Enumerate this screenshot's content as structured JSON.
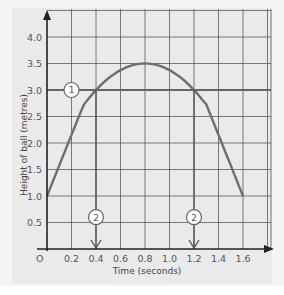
{
  "chart_data": {
    "type": "line",
    "title": "",
    "xlabel": "Time (seconds)",
    "ylabel": "Height of ball (metres)",
    "xlim": [
      0,
      1.6
    ],
    "ylim": [
      0,
      4.0
    ],
    "grid": true,
    "x_ticks": [
      "0",
      "0.2",
      "0.4",
      "0.6",
      "0.8",
      "1.0",
      "1.2",
      "1.4",
      "1.6"
    ],
    "y_ticks": [
      "0.5",
      "1.0",
      "1.5",
      "2.0",
      "2.5",
      "3.0",
      "3.5",
      "4.0"
    ],
    "series": [
      {
        "name": "Height of ball",
        "x": [
          0,
          0.1,
          0.2,
          0.3,
          0.4,
          0.5,
          0.6,
          0.7,
          0.8,
          0.9,
          1.0,
          1.1,
          1.2,
          1.3,
          1.4,
          1.5,
          1.6
        ],
        "values": [
          1.0,
          1.73,
          2.28,
          2.73,
          3.0,
          3.23,
          3.38,
          3.47,
          3.5,
          3.47,
          3.38,
          3.23,
          3.0,
          2.73,
          2.28,
          1.73,
          1.0
        ]
      },
      {
        "name": "Reference line h = 3.0",
        "x": [
          0,
          1.6
        ],
        "values": [
          3.0,
          3.0
        ]
      }
    ],
    "annotations": [
      {
        "label": "1",
        "type": "circle-marker",
        "x": 0.2,
        "y": 3.0,
        "note": "horizontal line at 3.0 m"
      },
      {
        "label": "2",
        "type": "circle-marker-arrow",
        "x": 0.4,
        "y": 0.6,
        "note": "arrow down to t = 0.4 s"
      },
      {
        "label": "2",
        "type": "circle-marker-arrow",
        "x": 1.2,
        "y": 0.6,
        "note": "arrow down to t = 1.2 s"
      }
    ],
    "legend": "none"
  },
  "labels": {
    "xlabel": "Time (seconds)",
    "ylabel": "Height of ball (metres)",
    "origin": "O",
    "marker1": "1",
    "marker2": "2"
  },
  "colors": {
    "panel_bg": "#eaeaea",
    "grid": "#5a5a5a",
    "axis": "#222222",
    "curve": "#6e6e6e",
    "ref_line": "#666666"
  }
}
